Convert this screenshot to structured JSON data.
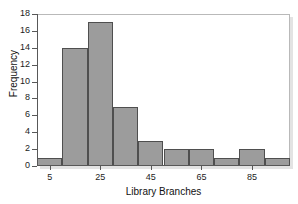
{
  "chart_data": {
    "type": "bar",
    "title": "",
    "xlabel": "Library Branches",
    "ylabel": "Frequency",
    "categories": [
      "5",
      "15",
      "25",
      "35",
      "45",
      "55",
      "65",
      "75",
      "85",
      "95"
    ],
    "bin_edges": [
      0,
      10,
      20,
      30,
      40,
      50,
      60,
      70,
      80,
      90,
      100
    ],
    "values": [
      1,
      14,
      17,
      7,
      3,
      2,
      2,
      1,
      2,
      1
    ],
    "xlim": [
      0,
      100
    ],
    "ylim": [
      0,
      18
    ],
    "y_ticks": [
      18,
      16,
      14,
      12,
      10,
      8,
      6,
      4,
      2,
      0
    ],
    "x_ticks": [
      5,
      25,
      45,
      65,
      85
    ],
    "x_tick_labels": [
      "5",
      "25",
      "45",
      "65",
      "85"
    ],
    "grid": false,
    "legend": false,
    "bar_fill_color": "#9c9c9c",
    "bar_border_color": "#4f4f4f",
    "axis_color": "#585858",
    "frame_color": "#b9b9b9"
  }
}
